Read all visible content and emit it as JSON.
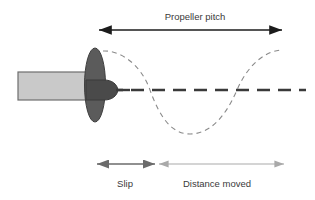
{
  "diagram": {
    "background_color": "#ffffff",
    "labels": {
      "propeller_pitch": "Propeller pitch",
      "slip": "Slip",
      "distance_moved": "Distance moved"
    },
    "colors": {
      "hull_fill": "#c9c9c9",
      "hull_stroke": "#6e6e6e",
      "blade_fill": "#5b5b5b",
      "blade_stroke": "#3f3f3f",
      "cone_fill": "#4a4a4a",
      "cone_stroke": "#3a3a3a",
      "centerline": "#3a3a3a",
      "helix_dash": "#8a8a8a",
      "pitch_arrow": "#1c1c1c",
      "slip_arrow": "#6b6b6b",
      "distance_arrow": "#a9a9a9",
      "text": "#3a3a3a"
    },
    "measurements": {
      "propeller_pitch": {
        "label": "Propeller pitch",
        "x_start": 98,
        "x_end": 283,
        "y": 30,
        "arrowheads": "both"
      },
      "slip": {
        "label": "Slip",
        "x_start": 96,
        "x_end": 156,
        "y": 164,
        "arrowheads": "both"
      },
      "distance_moved": {
        "label": "Distance moved",
        "x_start": 158,
        "x_end": 285,
        "y": 164,
        "arrowheads": "both"
      }
    },
    "shapes": {
      "hull": {
        "x": 18,
        "y": 72,
        "width": 77,
        "height": 28
      },
      "propeller_blade": {
        "cx": 95,
        "cy": 85,
        "rx": 10.5,
        "ry": 37
      },
      "nose_cone": {
        "x_base": 88,
        "x_tip": 118,
        "cy": 90,
        "half_height": 10
      },
      "shaft_line": {
        "x_start": 108,
        "x_end": 128,
        "y": 90
      },
      "centerline": {
        "x_start": 110,
        "x_end": 306,
        "y": 90
      }
    },
    "helix_path": {
      "description": "dashed sine wave representing one revolution of the propeller",
      "x_start": 103,
      "x_end": 283,
      "y_crest": 50,
      "y_axis": 90,
      "y_trough": 134,
      "crossings": [
        150,
        237
      ]
    }
  }
}
